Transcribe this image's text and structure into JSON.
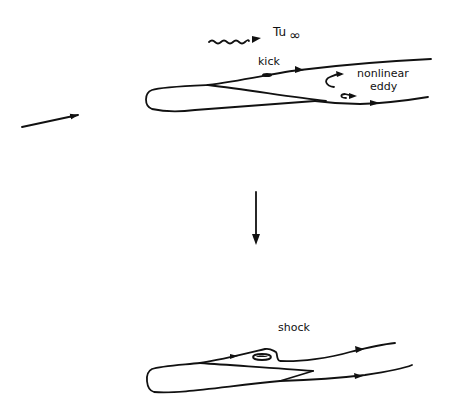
{
  "labels": {
    "freestream_turbulence": "Tu",
    "freestream_subscript": "∞",
    "kick": "kick",
    "nonlinear": "nonlinear",
    "eddy": "eddy",
    "shock": "shock"
  },
  "icons": {
    "wavy_arrow": "turbulence-wave-arrow-icon",
    "incoming_flow_arrow": "flow-arrow-icon",
    "transition_arrow": "down-arrow-icon"
  }
}
